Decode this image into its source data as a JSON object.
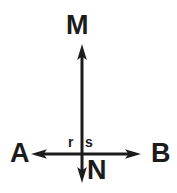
{
  "figure": {
    "type": "geometry-diagram",
    "background_color": "#ffffff",
    "stroke_color": "#1c1c1c",
    "width": 177,
    "height": 193,
    "lines": [
      {
        "name": "vertical-line-MN",
        "orientation": "vertical",
        "x": 82,
        "y_start": 45,
        "y_end": 182,
        "stroke_width": 3,
        "arrow_start": "up",
        "arrow_end": "down",
        "endpoint_labels": [
          "M",
          "N"
        ]
      },
      {
        "name": "horizontal-line-AB",
        "orientation": "horizontal",
        "y": 154,
        "x_start": 32,
        "x_end": 140,
        "stroke_width": 3,
        "arrow_start": "left",
        "arrow_end": "right",
        "endpoint_labels": [
          "A",
          "B"
        ]
      }
    ],
    "intersection": {
      "x": 82,
      "y": 154
    },
    "labels": {
      "top": "M",
      "left": "A",
      "right": "B",
      "bottom": "N",
      "angle_left": "r",
      "angle_right": "s"
    }
  }
}
